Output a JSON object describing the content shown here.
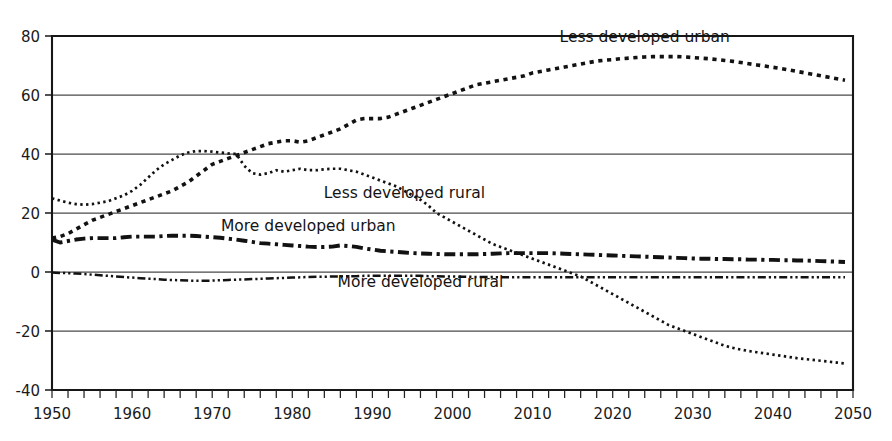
{
  "chart_data": {
    "type": "line",
    "title": "",
    "subtitle": "",
    "xlabel": "",
    "ylabel": "",
    "xlim": [
      1950,
      2050
    ],
    "ylim": [
      -40,
      80
    ],
    "grid": true,
    "legend_position": "inline-annotations",
    "x_ticks": [
      "1950",
      "1960",
      "1970",
      "1980",
      "1990",
      "2000",
      "2010",
      "2020",
      "2030",
      "2040",
      "2050"
    ],
    "x_tick_values": [
      1950,
      1960,
      1970,
      1980,
      1990,
      2000,
      2010,
      2020,
      2030,
      2040,
      2050
    ],
    "y_ticks": [
      "80",
      "60",
      "40",
      "20",
      "0",
      "-20",
      "-40"
    ],
    "y_tick_values": [
      80,
      60,
      40,
      20,
      0,
      -20,
      -40
    ],
    "x": [
      1950,
      1951,
      1952,
      1953,
      1954,
      1955,
      1956,
      1957,
      1958,
      1959,
      1960,
      1961,
      1962,
      1963,
      1964,
      1965,
      1966,
      1967,
      1968,
      1969,
      1970,
      1971,
      1972,
      1973,
      1974,
      1975,
      1976,
      1977,
      1978,
      1979,
      1980,
      1981,
      1982,
      1983,
      1984,
      1985,
      1986,
      1987,
      1988,
      1989,
      1990,
      1991,
      1992,
      1993,
      1994,
      1995,
      1996,
      1997,
      1998,
      1999,
      2000,
      2001,
      2002,
      2003,
      2004,
      2005,
      2006,
      2007,
      2008,
      2009,
      2010,
      2011,
      2012,
      2013,
      2014,
      2015,
      2016,
      2017,
      2018,
      2019,
      2020,
      2021,
      2022,
      2023,
      2024,
      2025,
      2026,
      2027,
      2028,
      2029,
      2030,
      2031,
      2032,
      2033,
      2034,
      2035,
      2036,
      2037,
      2038,
      2039,
      2040,
      2041,
      2042,
      2043,
      2044,
      2045,
      2046,
      2047,
      2048,
      2049
    ],
    "series": [
      {
        "name": "Less developed urban",
        "style": "dotted-square-large",
        "label_x": 2024,
        "label_y": 78,
        "values": [
          11.5,
          12.0,
          13.0,
          14.5,
          16.0,
          17.5,
          18.5,
          19.5,
          20.5,
          21.5,
          22.5,
          23.5,
          24.5,
          25.5,
          26.5,
          27.5,
          29.0,
          30.5,
          32.5,
          34.5,
          36.5,
          37.5,
          38.5,
          39.5,
          40.5,
          41.5,
          42.5,
          43.5,
          44.0,
          44.5,
          44.5,
          44.0,
          44.5,
          45.5,
          46.5,
          47.5,
          48.5,
          50.0,
          51.5,
          52.0,
          52.0,
          52.0,
          52.5,
          53.5,
          54.5,
          55.5,
          56.5,
          57.5,
          58.5,
          59.5,
          60.5,
          61.5,
          62.5,
          63.5,
          64.0,
          64.5,
          65.0,
          65.5,
          66.0,
          66.5,
          67.5,
          68.0,
          68.5,
          69.0,
          69.5,
          70.0,
          70.5,
          71.0,
          71.5,
          71.8,
          72.0,
          72.3,
          72.5,
          72.7,
          72.9,
          73.0,
          73.0,
          73.0,
          73.0,
          72.9,
          72.7,
          72.5,
          72.3,
          72.0,
          71.7,
          71.4,
          71.0,
          70.6,
          70.2,
          69.8,
          69.4,
          69.0,
          68.5,
          68.0,
          67.5,
          67.0,
          66.5,
          66.0,
          65.5,
          65.0
        ]
      },
      {
        "name": "Less developed rural",
        "style": "dotted-small",
        "label_x": 1994,
        "label_y": 25,
        "values": [
          25.0,
          24.2,
          23.5,
          23.0,
          22.8,
          23.0,
          23.5,
          24.0,
          25.0,
          26.0,
          27.5,
          29.5,
          32.0,
          34.5,
          36.5,
          38.0,
          39.5,
          40.5,
          41.0,
          41.0,
          40.8,
          40.5,
          40.2,
          40.0,
          36.0,
          33.5,
          33.0,
          33.5,
          34.5,
          34.0,
          34.5,
          35.0,
          34.5,
          34.5,
          34.8,
          35.0,
          35.0,
          34.5,
          34.0,
          33.0,
          32.0,
          31.0,
          30.0,
          29.0,
          27.5,
          26.0,
          24.5,
          22.5,
          20.0,
          18.5,
          17.0,
          15.5,
          14.0,
          12.5,
          11.0,
          9.5,
          8.5,
          7.5,
          6.5,
          5.5,
          4.5,
          3.5,
          2.5,
          1.5,
          0.5,
          -0.5,
          -1.5,
          -3.0,
          -4.5,
          -6.0,
          -7.5,
          -9.0,
          -10.5,
          -12.0,
          -13.5,
          -15.0,
          -16.5,
          -18.0,
          -19.0,
          -20.0,
          -21.0,
          -22.0,
          -23.0,
          -24.0,
          -25.0,
          -25.7,
          -26.3,
          -26.8,
          -27.2,
          -27.6,
          -28.0,
          -28.4,
          -28.8,
          -29.2,
          -29.5,
          -29.8,
          -30.1,
          -30.4,
          -30.7,
          -31.0
        ]
      },
      {
        "name": "More developed urban",
        "style": "dash-dot-heavy",
        "label_x": 1982,
        "label_y": 14,
        "values": [
          11.0,
          10.0,
          10.5,
          11.0,
          11.3,
          11.5,
          11.5,
          11.5,
          11.5,
          11.8,
          12.0,
          12.0,
          12.0,
          12.0,
          12.2,
          12.3,
          12.3,
          12.3,
          12.2,
          12.0,
          11.8,
          11.6,
          11.3,
          11.0,
          10.6,
          10.2,
          9.8,
          9.6,
          9.4,
          9.2,
          9.0,
          8.8,
          8.6,
          8.5,
          8.5,
          8.6,
          9.0,
          8.8,
          8.5,
          8.0,
          7.6,
          7.2,
          7.0,
          6.8,
          6.6,
          6.4,
          6.3,
          6.2,
          6.1,
          6.0,
          6.0,
          6.0,
          6.0,
          6.0,
          6.1,
          6.2,
          6.3,
          6.4,
          6.4,
          6.4,
          6.4,
          6.4,
          6.4,
          6.3,
          6.2,
          6.1,
          6.0,
          5.9,
          5.8,
          5.7,
          5.6,
          5.5,
          5.4,
          5.3,
          5.2,
          5.1,
          5.0,
          4.9,
          4.8,
          4.7,
          4.6,
          4.5,
          4.5,
          4.4,
          4.4,
          4.3,
          4.3,
          4.2,
          4.2,
          4.1,
          4.1,
          4.0,
          4.0,
          3.9,
          3.9,
          3.8,
          3.7,
          3.6,
          3.5,
          3.4
        ]
      },
      {
        "name": "More developed rural",
        "style": "dash-dot-dot-thin",
        "label_x": 1996,
        "label_y": -5,
        "values": [
          -0.2,
          -0.3,
          -0.4,
          -0.5,
          -0.7,
          -0.9,
          -1.1,
          -1.3,
          -1.5,
          -1.7,
          -1.9,
          -2.1,
          -2.3,
          -2.4,
          -2.6,
          -2.7,
          -2.8,
          -2.9,
          -3.0,
          -3.0,
          -2.9,
          -2.8,
          -2.7,
          -2.6,
          -2.5,
          -2.4,
          -2.3,
          -2.2,
          -2.1,
          -2.0,
          -1.9,
          -1.8,
          -1.7,
          -1.6,
          -1.6,
          -1.5,
          -1.5,
          -1.4,
          -1.4,
          -1.3,
          -1.3,
          -1.3,
          -1.3,
          -1.3,
          -1.3,
          -1.3,
          -1.3,
          -1.4,
          -1.4,
          -1.5,
          -1.5,
          -1.6,
          -1.6,
          -1.7,
          -1.7,
          -1.7,
          -1.8,
          -1.8,
          -1.8,
          -1.8,
          -1.8,
          -1.8,
          -1.8,
          -1.8,
          -1.8,
          -1.8,
          -1.8,
          -1.8,
          -1.8,
          -1.8,
          -1.8,
          -1.8,
          -1.8,
          -1.8,
          -1.8,
          -1.8,
          -1.8,
          -1.8,
          -1.8,
          -1.8,
          -1.8,
          -1.8,
          -1.8,
          -1.8,
          -1.8,
          -1.8,
          -1.8,
          -1.8,
          -1.8,
          -1.8,
          -1.8,
          -1.8,
          -1.8,
          -1.8,
          -1.8,
          -1.8,
          -1.8,
          -1.8,
          -1.8,
          -1.8
        ]
      }
    ]
  },
  "colors": {
    "background": "#ffffff",
    "axis": "#171717",
    "grid": "#4a4a4a",
    "series": "#121212",
    "text": "#1a1a1a"
  }
}
